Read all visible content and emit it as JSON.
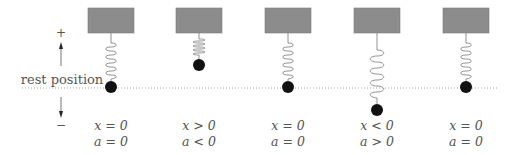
{
  "diagram": {
    "rest_label": "rest position",
    "axis": {
      "plus_label": "+",
      "minus_label": "−"
    },
    "colors": {
      "block": "#8a8a8a",
      "block_border": "#7a7a7a",
      "spring": "#777777",
      "ball": "#111111",
      "rest_line": "#999999",
      "text": "#555555"
    },
    "states": [
      {
        "id": 1,
        "x_label": "x = 0",
        "a_label": "a = 0",
        "state": "rest"
      },
      {
        "id": 2,
        "x_label": "x > 0",
        "a_label": "a < 0",
        "state": "compressed"
      },
      {
        "id": 3,
        "x_label": "x = 0",
        "a_label": "a = 0",
        "state": "rest"
      },
      {
        "id": 4,
        "x_label": "x < 0",
        "a_label": "a > 0",
        "state": "stretched"
      },
      {
        "id": 5,
        "x_label": "x = 0",
        "a_label": "a = 0",
        "state": "rest"
      }
    ]
  }
}
